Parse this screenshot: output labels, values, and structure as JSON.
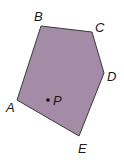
{
  "figure": {
    "type": "pentagon-diagram",
    "fill_color": "#a48ba6",
    "stroke_color": "#3a3a3a",
    "vertices": [
      {
        "label": "A"
      },
      {
        "label": "B"
      },
      {
        "label": "C"
      },
      {
        "label": "D"
      },
      {
        "label": "E"
      }
    ],
    "interior_point": {
      "label": "P"
    }
  }
}
